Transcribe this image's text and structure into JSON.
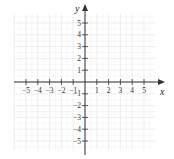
{
  "diagram": {
    "type": "coordinate-plane",
    "x_axis_label": "x",
    "y_axis_label": "y",
    "x_range": [
      -5,
      5
    ],
    "y_range": [
      -5,
      5
    ],
    "x_tick_labels": [
      "−5",
      "−4",
      "−3",
      "−2",
      "−1",
      "1",
      "2",
      "3",
      "4",
      "5"
    ],
    "y_tick_labels": [
      "5",
      "4",
      "3",
      "2",
      "1",
      "−1",
      "−2",
      "−3",
      "−4",
      "−5"
    ],
    "grid": true,
    "colors": {
      "axis": "#333333",
      "grid_major": "#e6e6e6",
      "grid_minor": "#f2f2f2"
    }
  }
}
